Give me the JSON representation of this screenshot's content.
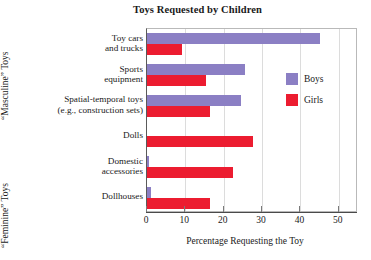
{
  "chart_data": {
    "type": "bar",
    "orientation": "horizontal",
    "title": "Toys Requested by Children",
    "xlabel": "Percentage Requesting the Toy",
    "ylabel": "",
    "xlim": [
      0,
      55
    ],
    "xticks": [
      0,
      10,
      20,
      30,
      40,
      50
    ],
    "xtick_labels": [
      "0",
      "10",
      "20",
      "30",
      "40",
      "50"
    ],
    "grid": true,
    "legend_position": "right",
    "categories": [
      "Toy cars and trucks",
      "Sports equipment",
      "Spatial-temporal toys (e.g., construction sets)",
      "Dolls",
      "Domestic accessories",
      "Dollhouses"
    ],
    "category_lines": [
      [
        "Toy cars",
        "and trucks"
      ],
      [
        "Sports",
        "equipment"
      ],
      [
        "Spatial-temporal toys",
        "(e.g., construction sets)"
      ],
      [
        "Dolls",
        ""
      ],
      [
        "Domestic",
        "accessories"
      ],
      [
        "Dollhouses",
        ""
      ]
    ],
    "series": [
      {
        "name": "Boys",
        "color": "#8b7fc4",
        "values": [
          45,
          25.5,
          24.5,
          0,
          0.5,
          1
        ]
      },
      {
        "name": "Girls",
        "color": "#ec1c30",
        "values": [
          9,
          15.5,
          16.5,
          27.5,
          22.5,
          16.5
        ]
      }
    ],
    "group_labels": [
      {
        "text": "“Masculine” Toys",
        "categories": [
          "Toy cars and trucks",
          "Sports equipment",
          "Spatial-temporal toys (e.g., construction sets)"
        ]
      },
      {
        "text": "“Feminine” Toys",
        "categories": [
          "Dolls",
          "Domestic accessories",
          "Dollhouses"
        ]
      }
    ],
    "legend": [
      {
        "label": "Boys",
        "color": "#8b7fc4"
      },
      {
        "label": "Girls",
        "color": "#ec1c30"
      }
    ]
  }
}
